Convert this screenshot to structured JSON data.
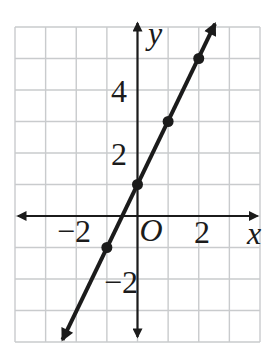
{
  "figure": {
    "background": "#ffffff"
  },
  "chart_data": {
    "type": "line",
    "title": "",
    "x_axis_label": "x",
    "y_axis_label": "y",
    "origin_label": "O",
    "xlim": [
      -4,
      4
    ],
    "ylim": [
      -4,
      6
    ],
    "grid": true,
    "grid_color": "#c9cbcd",
    "axis_color": "#1b1b1b",
    "line_color": "#1b1b1b",
    "point_color": "#1b1b1b",
    "x_ticks": [
      {
        "value": -2,
        "label": "−2"
      },
      {
        "value": 2,
        "label": "2"
      }
    ],
    "y_ticks": [
      {
        "value": 4,
        "label": "4"
      },
      {
        "value": 2,
        "label": "2"
      },
      {
        "value": -2,
        "label": "−2"
      }
    ],
    "points": [
      [
        -1,
        -1
      ],
      [
        0,
        1
      ],
      [
        1,
        3
      ],
      [
        2,
        5
      ]
    ],
    "line_segment": {
      "start": [
        -2.45,
        -3.93
      ],
      "end": [
        2.53,
        6.1
      ],
      "arrows": "both"
    }
  }
}
